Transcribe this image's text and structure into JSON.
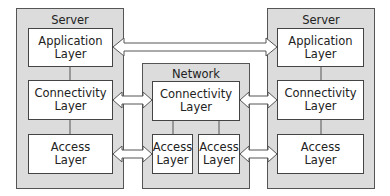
{
  "diagram": {
    "left_server": {
      "title": "Server",
      "layers": [
        {
          "line1": "Application",
          "line2": "Layer"
        },
        {
          "line1": "Connectivity",
          "line2": "Layer"
        },
        {
          "line1": "Access",
          "line2": "Layer"
        }
      ]
    },
    "network": {
      "title": "Network",
      "connectivity": {
        "line1": "Connectivity",
        "line2": "Layer"
      },
      "access_left": {
        "line1": "Access",
        "line2": "Layer"
      },
      "access_right": {
        "line1": "Access",
        "line2": "Layer"
      }
    },
    "right_server": {
      "title": "Server",
      "layers": [
        {
          "line1": "Application",
          "line2": "Layer"
        },
        {
          "line1": "Connectivity",
          "line2": "Layer"
        },
        {
          "line1": "Access",
          "line2": "Layer"
        }
      ]
    },
    "colors": {
      "group_fill": "#dcdcdc",
      "box_fill": "#ffffff",
      "stroke": "#444444"
    }
  }
}
